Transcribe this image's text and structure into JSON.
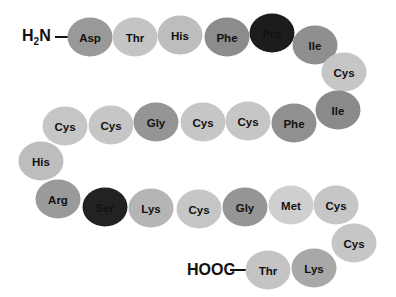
{
  "n_terminus": {
    "label_main": "H",
    "label_sub": "2",
    "label_end": "N"
  },
  "c_terminus": {
    "label": "HOOC"
  },
  "colors": {
    "light": "#c8c8c8",
    "medium": "#a3a3a3",
    "dark": "#8a8a8a",
    "darkest": "#1e1e1e"
  },
  "residues": [
    {
      "label": "Asp",
      "x": 90,
      "y": 37,
      "shade": "#999999"
    },
    {
      "label": "Thr",
      "x": 135,
      "y": 37,
      "shade": "#c4c4c4"
    },
    {
      "label": "His",
      "x": 180,
      "y": 35,
      "shade": "#bdbdbd"
    },
    {
      "label": "Phe",
      "x": 227,
      "y": 37,
      "shade": "#8c8c8c"
    },
    {
      "label": "Pro",
      "x": 272,
      "y": 33,
      "shade": "#1c1c1c"
    },
    {
      "label": "Ile",
      "x": 315,
      "y": 45,
      "shade": "#8f8f8f"
    },
    {
      "label": "Cys",
      "x": 344,
      "y": 72,
      "shade": "#c6c6c6"
    },
    {
      "label": "Ile",
      "x": 338,
      "y": 110,
      "shade": "#8a8a8a"
    },
    {
      "label": "Phe",
      "x": 294,
      "y": 123,
      "shade": "#909090"
    },
    {
      "label": "Cys",
      "x": 248,
      "y": 121,
      "shade": "#c6c6c6"
    },
    {
      "label": "Cys",
      "x": 203,
      "y": 122,
      "shade": "#c6c6c6"
    },
    {
      "label": "Gly",
      "x": 156,
      "y": 122,
      "shade": "#959595"
    },
    {
      "label": "Cys",
      "x": 111,
      "y": 125,
      "shade": "#c6c6c6"
    },
    {
      "label": "Cys",
      "x": 65,
      "y": 126,
      "shade": "#c6c6c6"
    },
    {
      "label": "His",
      "x": 41,
      "y": 161,
      "shade": "#bdbdbd"
    },
    {
      "label": "Arg",
      "x": 58,
      "y": 199,
      "shade": "#9a9a9a"
    },
    {
      "label": "Ser",
      "x": 105,
      "y": 207,
      "shade": "#222222"
    },
    {
      "label": "Lys",
      "x": 151,
      "y": 208,
      "shade": "#b5b5b5"
    },
    {
      "label": "Cys",
      "x": 199,
      "y": 209,
      "shade": "#c6c6c6"
    },
    {
      "label": "Gly",
      "x": 245,
      "y": 207,
      "shade": "#959595"
    },
    {
      "label": "Met",
      "x": 291,
      "y": 205,
      "shade": "#cfcfcf"
    },
    {
      "label": "Cys",
      "x": 336,
      "y": 205,
      "shade": "#c6c6c6"
    },
    {
      "label": "Cys",
      "x": 354,
      "y": 243,
      "shade": "#c6c6c6"
    },
    {
      "label": "Lys",
      "x": 314,
      "y": 268,
      "shade": "#a8a8a8"
    },
    {
      "label": "Thr",
      "x": 268,
      "y": 270,
      "shade": "#c4c4c4"
    }
  ]
}
